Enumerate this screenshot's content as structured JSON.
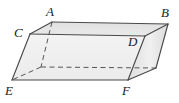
{
  "figure": {
    "name": "labeled-rectangular-prism",
    "type": "geometry-diagram",
    "projection": "oblique",
    "background_color": "#ffffff",
    "stroke_color": "#4a4a4a",
    "hidden_stroke_color": "#555555",
    "label_color": "#1a1a1a",
    "face_colors": {
      "top": "#e3e3e3",
      "front": "#efefef",
      "right": "#e8e8e8",
      "left": "#ececec"
    }
  },
  "labels": {
    "a": "A",
    "b": "B",
    "c": "C",
    "d": "D",
    "e": "E",
    "f": "F"
  },
  "vertices": {
    "A": {
      "label": "A",
      "x": 52,
      "y": 22,
      "position": "top-back-left",
      "hidden": false
    },
    "B": {
      "label": "B",
      "x": 168,
      "y": 24,
      "position": "top-back-right",
      "hidden": false
    },
    "C": {
      "label": "C",
      "x": 30,
      "y": 34,
      "position": "top-front-left",
      "hidden": false
    },
    "D": {
      "label": "D",
      "x": 145,
      "y": 36,
      "position": "top-front-right",
      "hidden": false
    },
    "E": {
      "label": "E",
      "x": 12,
      "y": 80,
      "position": "bottom-front-left",
      "hidden": false
    },
    "F": {
      "label": "F",
      "x": 128,
      "y": 80,
      "position": "bottom-front-right",
      "hidden": false
    },
    "G": {
      "label": "",
      "x": 41,
      "y": 67,
      "position": "bottom-back-left",
      "hidden": true
    },
    "H": {
      "label": "",
      "x": 156,
      "y": 68,
      "position": "bottom-back-right",
      "hidden": false
    }
  },
  "label_positions": {
    "A": {
      "x": 46,
      "y": 5
    },
    "B": {
      "x": 161,
      "y": 6
    },
    "C": {
      "x": 14,
      "y": 26
    },
    "D": {
      "x": 128,
      "y": 35
    },
    "E": {
      "x": 5,
      "y": 84
    },
    "F": {
      "x": 122,
      "y": 84
    }
  },
  "edges": {
    "visible": [
      {
        "name": "C-A",
        "from": "C",
        "to": "A"
      },
      {
        "name": "A-B",
        "from": "A",
        "to": "B"
      },
      {
        "name": "C-D",
        "from": "C",
        "to": "D"
      },
      {
        "name": "D-B",
        "from": "D",
        "to": "B"
      },
      {
        "name": "C-E",
        "from": "C",
        "to": "E"
      },
      {
        "name": "E-F",
        "from": "E",
        "to": "F"
      },
      {
        "name": "D-F",
        "from": "D",
        "to": "F"
      },
      {
        "name": "F-H",
        "from": "F",
        "to": "H"
      },
      {
        "name": "B-H",
        "from": "B",
        "to": "H"
      }
    ],
    "hidden": [
      {
        "name": "A-G",
        "from": "A",
        "to": "G"
      },
      {
        "name": "G-E",
        "from": "G",
        "to": "E"
      },
      {
        "name": "G-H",
        "from": "G",
        "to": "H"
      }
    ]
  }
}
